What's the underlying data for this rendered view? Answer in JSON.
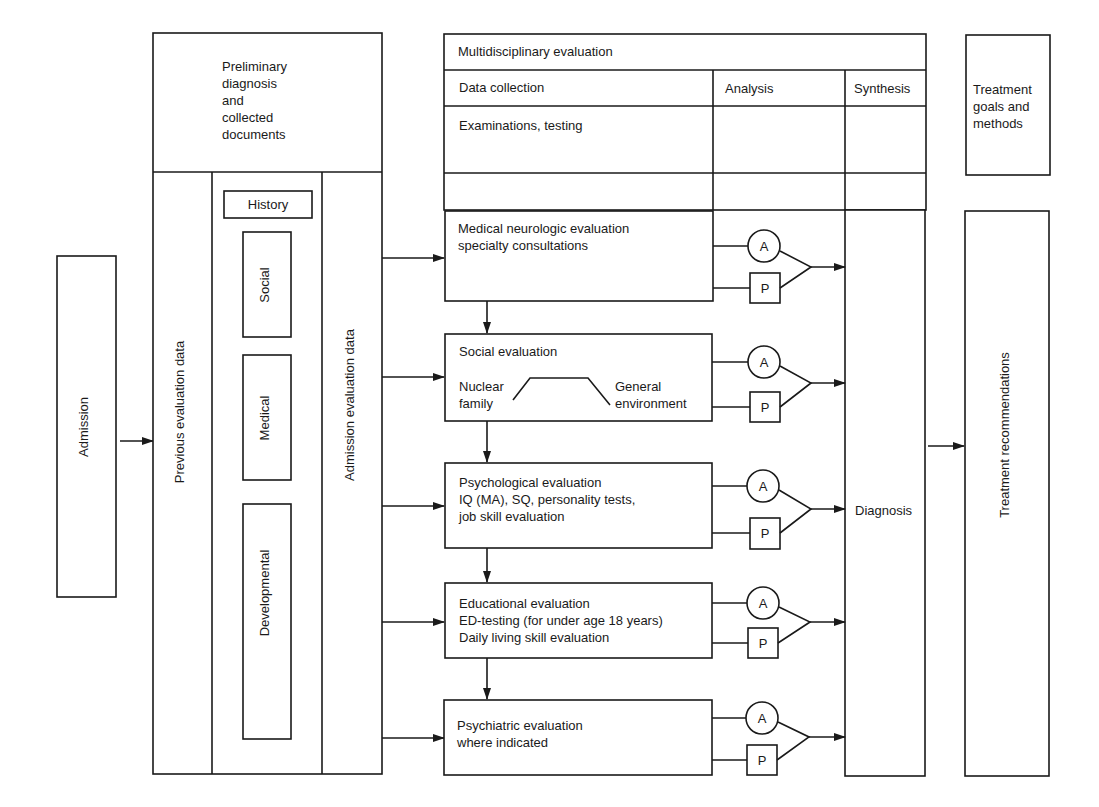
{
  "admission": {
    "label": "Admission"
  },
  "left_block": {
    "top_label_lines": [
      "Preliminary",
      "diagnosis",
      "and",
      "collected",
      "documents"
    ],
    "previous_label": "Previous evaluation data",
    "admission_eval_label": "Admission evaluation data",
    "history": {
      "title": "History",
      "items": [
        "Social",
        "Medical",
        "Developmental"
      ]
    }
  },
  "multidisciplinary": {
    "title": "Multidisciplinary evaluation",
    "columns": {
      "data_collection": "Data collection",
      "analysis": "Analysis",
      "synthesis": "Synthesis"
    },
    "subheader": "Examinations, testing",
    "synthesis_label": "Diagnosis",
    "evaluations": [
      {
        "lines": [
          "Medical neurologic evaluation",
          "specialty consultations"
        ]
      },
      {
        "lines": [
          "Social evaluation"
        ],
        "left_note": [
          "Nuclear",
          "family"
        ],
        "right_note": [
          "General",
          "environment"
        ]
      },
      {
        "lines": [
          "Psychological evaluation",
          "IQ (MA), SQ, personality tests,",
          "job skill evaluation"
        ]
      },
      {
        "lines": [
          "Educational evaluation",
          "ED-testing (for under age 18 years)",
          "Daily living skill evaluation"
        ]
      },
      {
        "lines": [
          "Psychiatric evaluation",
          "where indicated"
        ]
      }
    ],
    "analysis_nodes": {
      "circle": "A",
      "square": "P"
    }
  },
  "treatment": {
    "goals_lines": [
      "Treatment",
      "goals and",
      "methods"
    ],
    "recommendations_label": "Treatment recommendations"
  }
}
